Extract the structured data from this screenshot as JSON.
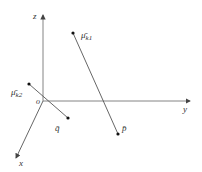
{
  "diagram": {
    "origin": {
      "label": "o",
      "x": 43,
      "y": 101
    },
    "axes": [
      {
        "name": "z",
        "label": "z",
        "from": [
          43,
          101
        ],
        "to": [
          43,
          15
        ],
        "label_pos": [
          33,
          19
        ]
      },
      {
        "name": "y",
        "label": "y",
        "from": [
          43,
          101
        ],
        "to": [
          190,
          101
        ],
        "label_pos": [
          183,
          112
        ]
      },
      {
        "name": "x",
        "label": "x",
        "from": [
          43,
          101
        ],
        "to": [
          16,
          158
        ],
        "label_pos": [
          19,
          166
        ]
      }
    ],
    "segments": [
      {
        "name": "mu-k1-to-p",
        "from": [
          73,
          33
        ],
        "to": [
          118,
          134
        ]
      },
      {
        "name": "mu-k2-to-q",
        "from": [
          29,
          84
        ],
        "to": [
          68,
          118
        ]
      }
    ],
    "points": [
      {
        "name": "mu-k1",
        "label": "μ̄",
        "sub": "k1",
        "x": 73,
        "y": 33,
        "label_pos": [
          81,
          38
        ]
      },
      {
        "name": "p",
        "label": "p̄",
        "x": 118,
        "y": 134,
        "label_pos": [
          122,
          131
        ]
      },
      {
        "name": "mu-k2",
        "label": "μ̄",
        "sub": "k2",
        "x": 29,
        "y": 84,
        "label_pos": [
          11,
          95
        ]
      },
      {
        "name": "q",
        "label": "q̄",
        "x": 68,
        "y": 118,
        "label_pos": [
          55,
          131
        ]
      }
    ],
    "colors": {
      "line": "#555555",
      "point": "#111111",
      "text": "#333333"
    }
  }
}
